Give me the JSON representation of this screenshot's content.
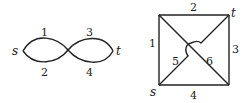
{
  "left_graph": {
    "source_label": "s",
    "sink_label": "t",
    "edges": [
      {
        "id": "1",
        "label": "1",
        "position": "top-left"
      },
      {
        "id": "2",
        "label": "2",
        "position": "bottom-left"
      },
      {
        "id": "3",
        "label": "3",
        "position": "top-right"
      },
      {
        "id": "4",
        "label": "4",
        "position": "bottom-right"
      }
    ]
  },
  "right_graph": {
    "source_label": "s",
    "sink_label": "t",
    "edges": [
      {
        "id": "1",
        "label": "1",
        "position": "left side"
      },
      {
        "id": "2",
        "label": "2",
        "position": "top side"
      },
      {
        "id": "3",
        "label": "3",
        "position": "right side"
      },
      {
        "id": "4",
        "label": "4",
        "position": "bottom side"
      },
      {
        "id": "5",
        "label": "5",
        "position": "diagonal s to t (with bridge)"
      },
      {
        "id": "6",
        "label": "6",
        "position": "diagonal top-left to bottom-right"
      }
    ]
  }
}
